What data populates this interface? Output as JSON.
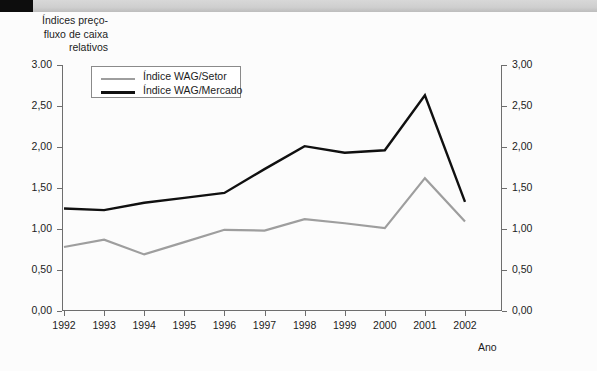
{
  "header": {
    "block_color": "#0d0d0d",
    "bar_color": "#cfcfcf"
  },
  "chart_title_text": "Índices preço-\nfluxo de caixa\nrelativos",
  "axis": {
    "x_title": "Ano",
    "y_tick_labels_left": [
      "3.00",
      "2,50",
      "2,00",
      "1,50",
      "1,00",
      "0,50",
      "0,00"
    ],
    "y_tick_labels_right": [
      "3,00",
      "2,50",
      "2,00",
      "1,50",
      "1,00",
      "0,50",
      "0,00"
    ],
    "y_tick_values": [
      3.0,
      2.5,
      2.0,
      1.5,
      1.0,
      0.5,
      0.0
    ]
  },
  "legend": {
    "entries": [
      {
        "label": "Índice WAG/Setor",
        "color": "#9e9e9e"
      },
      {
        "label": "Índice WAG/Mercado",
        "color": "#101010"
      }
    ]
  },
  "chart_data": {
    "type": "line",
    "xlabel": "Ano",
    "ylabel": "Índices preço-fluxo de caixa relativos",
    "x": [
      1992,
      1993,
      1994,
      1995,
      1996,
      1997,
      1998,
      1999,
      2000,
      2001,
      2002
    ],
    "categories": [
      "1992",
      "1993",
      "1994",
      "1995",
      "1996",
      "1997",
      "1998",
      "1999",
      "2000",
      "2001",
      "2002"
    ],
    "ylim": [
      0.0,
      3.0
    ],
    "ytick_step": 0.5,
    "grid": false,
    "legend_position": "top-left-inside",
    "dual_axis": true,
    "series": [
      {
        "name": "Índice WAG/Setor",
        "color": "#9e9e9e",
        "values": [
          0.78,
          0.87,
          0.69,
          0.84,
          0.99,
          0.98,
          1.12,
          1.07,
          1.01,
          1.62,
          1.09
        ]
      },
      {
        "name": "Índice WAG/Mercado",
        "color": "#101010",
        "values": [
          1.25,
          1.23,
          1.32,
          1.38,
          1.44,
          1.73,
          2.01,
          1.93,
          1.96,
          2.63,
          1.33
        ]
      }
    ]
  }
}
